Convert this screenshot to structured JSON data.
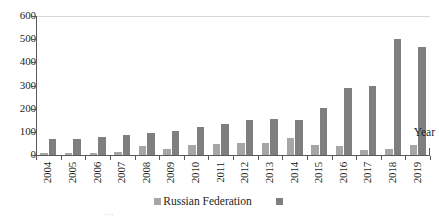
{
  "chart_data": {
    "type": "bar",
    "title": "",
    "subtitle": "",
    "xlabel": "Year",
    "ylabel": "",
    "grid": false,
    "legend_position": "bottom",
    "ylim": [
      0,
      600
    ],
    "yticks": [
      0,
      100,
      200,
      300,
      400,
      500,
      600
    ],
    "ytick_labels": [
      "0",
      "100",
      "200",
      "300",
      "400",
      "500",
      "600"
    ],
    "categories": [
      "2004",
      "2005",
      "2006",
      "2007",
      "2008",
      "2009",
      "2010",
      "2011",
      "2012",
      "2013",
      "2014",
      "2015",
      "2016",
      "2017",
      "2018",
      "2019"
    ],
    "series": [
      {
        "name": "Russian Federation",
        "color": "#a6a6a6",
        "values": [
          8,
          7,
          10,
          12,
          40,
          28,
          45,
          48,
          50,
          50,
          75,
          45,
          38,
          22,
          25,
          42
        ]
      },
      {
        "name": "",
        "color": "#7f7f7f",
        "values": [
          70,
          70,
          78,
          85,
          95,
          105,
          120,
          135,
          150,
          155,
          150,
          205,
          290,
          300,
          500,
          468
        ]
      }
    ]
  },
  "axis": {
    "x_title": "Year"
  },
  "legend": {
    "items": [
      {
        "label": "Russian Federation",
        "color": "#a6a6a6"
      },
      {
        "label": "",
        "color": "#7f7f7f"
      }
    ]
  },
  "caption": {
    "fragment": "···"
  }
}
